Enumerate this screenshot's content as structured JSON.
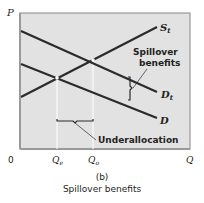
{
  "figure": {
    "panel_label": "(b)",
    "caption": "Spillover benefits",
    "axis_y_label": "P",
    "axis_x_label": "Q",
    "origin_label": "0",
    "qe_label": "Q",
    "qe_sub": "e",
    "qo_label": "Q",
    "qo_sub": "o",
    "curves": {
      "st_label": "S",
      "st_sub": "t",
      "dt_label": "D",
      "dt_sub": "t",
      "d_label": "D"
    },
    "annotations": {
      "spillover_line1": "Spillover",
      "spillover_line2": "benefits",
      "underallocation": "Underallocation"
    },
    "colors": {
      "plot_background": "#e2e2e2",
      "frame": "#9a9a9a",
      "curve": "#2b2b2b",
      "guide_line": "#ffffff"
    }
  }
}
